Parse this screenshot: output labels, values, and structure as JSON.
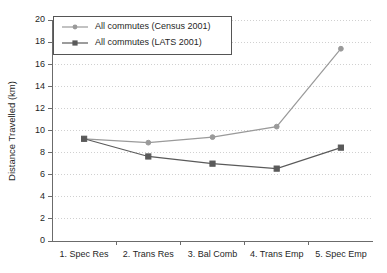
{
  "chart_data": {
    "type": "line",
    "title": "",
    "xlabel": "",
    "ylabel": "Distance Travelled (km)",
    "ylim": [
      0,
      20
    ],
    "ytick_step": 2,
    "yticks": [
      "0",
      "2",
      "4",
      "6",
      "8",
      "10",
      "12",
      "14",
      "16",
      "18",
      "20"
    ],
    "grid": true,
    "grid_axis": "y",
    "legend_position": "top-left",
    "categories": [
      "1. Spec Res",
      "2. Trans Res",
      "3. Bal Comb",
      "4. Trans Emp",
      "5. Spec Emp"
    ],
    "series": [
      {
        "name": "All commutes (Census 2001)",
        "values": [
          9.25,
          8.9,
          9.4,
          10.35,
          17.4
        ],
        "color": "#9a9a9a",
        "marker": "circle"
      },
      {
        "name": "All commutes (LATS 2001)",
        "values": [
          9.25,
          7.65,
          7.0,
          6.55,
          8.45
        ],
        "color": "#5a5a5a",
        "marker": "square"
      }
    ]
  },
  "legend": {
    "entries": [
      "All commutes (Census 2001)",
      "All commutes (LATS 2001)"
    ]
  },
  "colors": {
    "census": "#9a9a9a",
    "lats": "#5a5a5a",
    "axis": "#6b6b6b",
    "grid": "#d0d0d0",
    "text": "#1f1f1f"
  }
}
